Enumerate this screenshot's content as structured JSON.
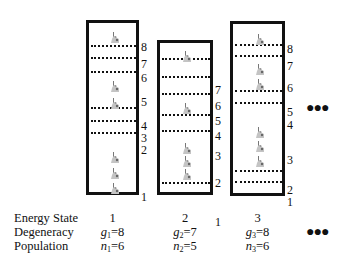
{
  "diagram": {
    "title": "",
    "states": [
      {
        "id": 1,
        "box": {
          "left": 86,
          "top": 20,
          "width": 53,
          "height": 175
        },
        "levels": [
          "8",
          "7",
          "6",
          "5",
          "4",
          "3",
          "2",
          "1"
        ],
        "level_label_y": [
          27,
          44,
          58,
          82,
          106,
          118,
          130,
          177
        ],
        "boundaries_y": [
          22,
          34,
          48,
          84,
          97,
          109
        ],
        "atoms_y": [
          7,
          56,
          73,
          127,
          143,
          158
        ],
        "energy_state": "1",
        "degeneracy": {
          "sym": "g",
          "sub": "1",
          "val": "=8"
        },
        "population": {
          "sym": "n",
          "sub": "1",
          "val": "=6"
        }
      },
      {
        "id": 2,
        "box": {
          "left": 157,
          "top": 40,
          "width": 56,
          "height": 155
        },
        "levels": [
          "7",
          "6",
          "5",
          "4",
          "3",
          "2",
          "1"
        ],
        "level_label_y": [
          50,
          66,
          81,
          96,
          116,
          143,
          182
        ],
        "boundaries_y": [
          15,
          33,
          50,
          71,
          87,
          139
        ],
        "atoms_y": [
          6,
          58,
          98,
          111,
          124
        ],
        "energy_state": "2",
        "degeneracy": {
          "sym": "g",
          "sub": "2",
          "val": "=7"
        },
        "population": {
          "sym": "n",
          "sub": "2",
          "val": "=5"
        }
      },
      {
        "id": 3,
        "box": {
          "left": 230,
          "top": 21,
          "width": 55,
          "height": 175
        },
        "levels": [
          "8",
          "7",
          "6",
          "5",
          "4",
          "3",
          "2",
          "1"
        ],
        "level_label_y": [
          28,
          45,
          67,
          91,
          104,
          139,
          169,
          181
        ],
        "boundaries_y": [
          20,
          31,
          66,
          78,
          146,
          157
        ],
        "atoms_y": [
          8,
          38,
          53,
          101,
          115,
          130
        ],
        "energy_state": "3",
        "degeneracy": {
          "sym": "g",
          "sub": "3",
          "val": "=8"
        },
        "population": {
          "sym": "n",
          "sub": "3",
          "val": "=6"
        }
      }
    ],
    "ellipsis": "●●●",
    "row_labels": {
      "energy_state": "Energy State",
      "degeneracy": "Degeneracy",
      "population": "Population"
    },
    "colors": {
      "ink": "#111111",
      "atom": "#b8b8b8",
      "background": "#ffffff"
    }
  }
}
